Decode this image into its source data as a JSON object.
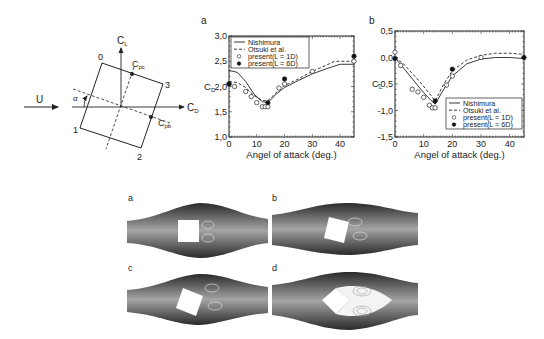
{
  "diagram": {
    "flow_label": "U",
    "lift_axis_label": "C",
    "lift_axis_sub": "L",
    "drag_axis_label": "C",
    "drag_axis_sub": "D",
    "angle_label": "α",
    "cpc_label": "C",
    "cpc_sub": "pc",
    "cpb_label": "C",
    "cpb_sub": "pb",
    "corners": [
      "0",
      "1",
      "2",
      "3"
    ]
  },
  "panels": {
    "a_label": "a",
    "b_label": "b",
    "c_label": "c",
    "d_label": "d"
  },
  "legend": {
    "nishimura": "Nishimura",
    "otsuki": "Otsuki et al.",
    "present_1d": "present(L = 1D)",
    "present_6d": "present(L = 6D)"
  },
  "chart_data": [
    {
      "type": "line",
      "panel": "a",
      "title": "",
      "xlabel": "Angel of attack (deg.)",
      "ylabel": "C_D",
      "xlim": [
        0,
        45
      ],
      "ylim": [
        1.0,
        3.0
      ],
      "xticks": [
        "0",
        "10",
        "20",
        "30",
        "40"
      ],
      "yticks": [
        "1,0",
        "1,5",
        "2,0",
        "2,5",
        "3,0"
      ],
      "legend_position": "upper left",
      "series": [
        {
          "name": "Nishimura",
          "style": "solid line",
          "x": [
            0,
            3,
            6,
            9,
            12,
            14,
            17,
            20,
            25,
            30,
            35,
            40,
            45
          ],
          "y": [
            2.32,
            2.28,
            2.1,
            1.85,
            1.7,
            1.68,
            1.85,
            1.98,
            2.12,
            2.25,
            2.35,
            2.44,
            2.44
          ]
        },
        {
          "name": "Otsuki et al.",
          "style": "dashed line",
          "x": [
            0,
            3,
            6,
            9,
            12,
            14,
            17,
            20,
            25,
            30,
            35,
            38,
            45
          ],
          "y": [
            2.1,
            2.08,
            1.98,
            1.82,
            1.72,
            1.72,
            1.88,
            2.02,
            2.15,
            2.3,
            2.42,
            2.5,
            2.5
          ]
        },
        {
          "name": "present(L = 1D)",
          "style": "open circle",
          "x": [
            0,
            2,
            6,
            8,
            10,
            12,
            13,
            14,
            18,
            20,
            30,
            45
          ],
          "y": [
            2.05,
            2.0,
            1.9,
            1.8,
            1.68,
            1.6,
            1.6,
            1.6,
            1.97,
            2.05,
            2.3,
            2.5
          ]
        },
        {
          "name": "present(L = 6D)",
          "style": "filled circle",
          "x": [
            0,
            14,
            20,
            45
          ],
          "y": [
            2.05,
            1.68,
            2.15,
            2.6
          ]
        }
      ]
    },
    {
      "type": "line",
      "panel": "b",
      "title": "",
      "xlabel": "Angel of attack (deg.)",
      "ylabel": "C_L",
      "xlim": [
        0,
        45
      ],
      "ylim": [
        -1.5,
        0.5
      ],
      "xticks": [
        "0",
        "10",
        "20",
        "30",
        "40"
      ],
      "yticks": [
        "-1,5",
        "-1,0",
        "-0,5",
        "0,0",
        "0,5"
      ],
      "legend_position": "lower right",
      "series": [
        {
          "name": "Nishimura",
          "style": "solid line",
          "x": [
            0,
            3,
            6,
            9,
            12,
            14,
            17,
            20,
            25,
            30,
            35,
            40,
            45
          ],
          "y": [
            0.0,
            -0.2,
            -0.4,
            -0.6,
            -0.78,
            -0.88,
            -0.6,
            -0.35,
            -0.12,
            -0.03,
            0.0,
            0.0,
            -0.02
          ]
        },
        {
          "name": "Otsuki et al.",
          "style": "dashed line",
          "x": [
            0,
            3,
            6,
            9,
            12,
            14,
            17,
            20,
            25,
            30,
            35,
            40,
            45
          ],
          "y": [
            0.0,
            -0.12,
            -0.3,
            -0.48,
            -0.68,
            -0.82,
            -0.5,
            -0.25,
            -0.05,
            0.04,
            0.08,
            0.08,
            0.06
          ]
        },
        {
          "name": "present(L = 1D)",
          "style": "open circle",
          "x": [
            0,
            2,
            6,
            8,
            10,
            12,
            13,
            14,
            18,
            20,
            30
          ],
          "y": [
            0.1,
            -0.15,
            -0.6,
            -0.65,
            -0.75,
            -0.9,
            -0.95,
            -0.95,
            -0.52,
            -0.35,
            0.0
          ]
        },
        {
          "name": "present(L = 6D)",
          "style": "filled circle",
          "x": [
            0,
            14,
            20,
            45
          ],
          "y": [
            -0.02,
            -0.82,
            -0.22,
            0.0
          ]
        }
      ]
    }
  ]
}
